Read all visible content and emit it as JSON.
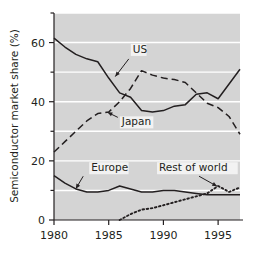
{
  "chart_data": {
    "type": "line",
    "title": "",
    "subtitle": "",
    "xlabel": "",
    "ylabel": "Semiconductor market share (%)",
    "xlim": [
      1980,
      1997
    ],
    "ylim": [
      0,
      70
    ],
    "xticks": [
      1980,
      1985,
      1990,
      1995
    ],
    "xtick_labels": [
      "1980",
      "1985",
      "1990",
      "1995"
    ],
    "yticks": [
      0,
      20,
      40,
      60
    ],
    "ytick_labels": [
      "0",
      "20",
      "40",
      "60"
    ],
    "yticks_minor": [
      10,
      30,
      50,
      70
    ],
    "gridlines": "horizontal white gridlines at 10, 20, 30, 40, 50, 60, 70",
    "grid": true,
    "legend": "inline annotations with arrows",
    "plot_background": "#d4d4d4",
    "x": [
      1980,
      1981,
      1982,
      1983,
      1984,
      1985,
      1986,
      1987,
      1988,
      1989,
      1990,
      1991,
      1992,
      1993,
      1994,
      1995,
      1996,
      1997
    ],
    "series": [
      {
        "name": "US",
        "style": "solid",
        "color": "#231f20",
        "values": [
          61.5,
          58.5,
          56.0,
          54.5,
          53.5,
          48.0,
          43.0,
          41.5,
          37.0,
          36.5,
          37.0,
          38.5,
          39.0,
          42.5,
          43.0,
          41.0,
          46.0,
          51.0
        ]
      },
      {
        "name": "Japan",
        "style": "dashed",
        "color": "#231f20",
        "values": [
          23.0,
          26.5,
          30.0,
          33.5,
          36.0,
          36.5,
          40.0,
          44.5,
          50.5,
          49.0,
          48.0,
          47.5,
          46.5,
          43.0,
          39.5,
          38.0,
          35.0,
          29.0
        ]
      },
      {
        "name": "Europe",
        "style": "solid",
        "color": "#231f20",
        "values": [
          15.0,
          12.5,
          10.5,
          9.5,
          9.5,
          10.0,
          11.5,
          10.5,
          9.5,
          9.5,
          10.0,
          10.0,
          9.5,
          9.0,
          8.5,
          8.5,
          8.5,
          8.5
        ]
      },
      {
        "name": "Rest of world",
        "style": "dotted",
        "color": "#231f20",
        "values": [
          null,
          null,
          null,
          null,
          null,
          null,
          0.0,
          2.0,
          3.5,
          4.0,
          5.0,
          6.0,
          7.0,
          8.0,
          9.0,
          11.5,
          9.5,
          11.0
        ]
      }
    ],
    "annotations": [
      {
        "label": "US",
        "text_x": 1987.2,
        "text_y": 56.5
      },
      {
        "label": "Japan",
        "text_x": 1986.2,
        "text_y": 32.0
      },
      {
        "label": "Europe",
        "text_x": 1983.4,
        "text_y": 16.5
      },
      {
        "label": "Rest of world",
        "text_x": 1989.6,
        "text_y": 16.5
      }
    ]
  }
}
